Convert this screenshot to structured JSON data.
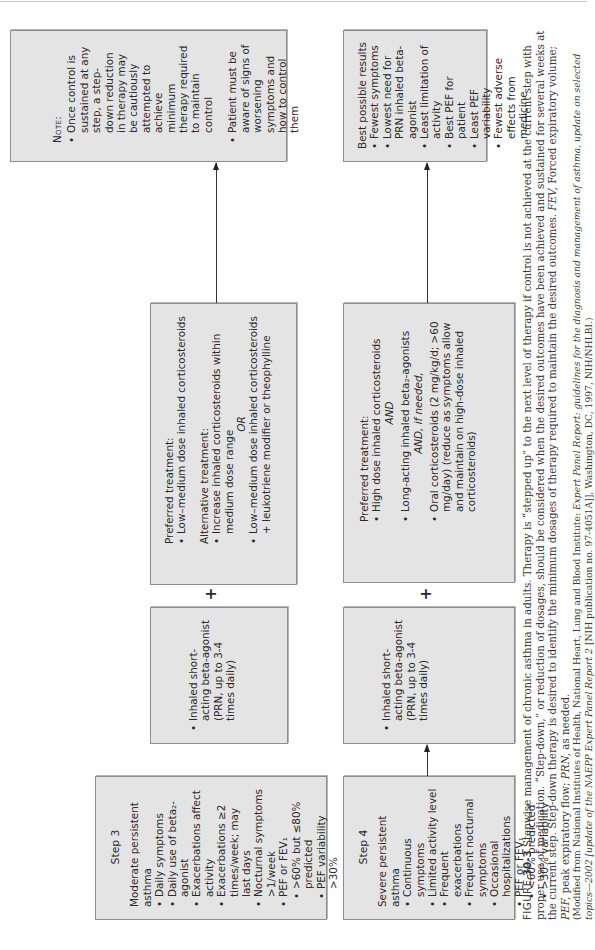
{
  "page": {
    "orientation": "rotated-landscape"
  },
  "step3": {
    "title": "Step 3",
    "severity": "Moderate persistent asthma",
    "items": [
      "Daily symptoms",
      "Daily use of beta₂-agonist",
      "Exacerbations affect activity",
      "Exacerbations ≥2 times/week; may last days",
      "Nocturnal symptoms >1/week",
      "PEF or FEV₁"
    ],
    "sub_items": [
      ">60% but ≤80% predicted",
      "PEF variability >30%"
    ]
  },
  "step4": {
    "title": "Step 4",
    "severity": "Severe persistent asthma",
    "items": [
      "Continuous symptoms",
      "Limited activity level",
      "Frequent exacerbations",
      "Frequent nocturnal symptoms",
      "Occasional hospitalizations",
      "PEF or FEV₁"
    ],
    "sub_items": [
      "<60% predicted",
      ">30% variability"
    ]
  },
  "saba3": {
    "items": [
      "Inhaled short-acting beta-agonist (PRN, up to 3-4 times daily)"
    ]
  },
  "saba4": {
    "items": [
      "Inhaled short-acting beta-agonist (PRN, up to 3-4 times daily)"
    ]
  },
  "plus_sign": "+",
  "pref3": {
    "preferred_label": "Preferred treatment:",
    "preferred_items": [
      "Low–medium dose inhaled corticosteroids"
    ],
    "alternative_label": "Alternative treatment:",
    "alternative_item_1": "Increase inhaled corticosteroids within medium dose range",
    "or_label": "OR",
    "alternative_item_2": "Low–medium dose inhaled corticosteroids",
    "alternative_item_2_addon": "+ leukotriene modifier or theophylline"
  },
  "pref4": {
    "preferred_label": "Preferred treatment:",
    "item_1": "High dose inhaled corticosteroids",
    "and_label": "AND",
    "item_2": "Long-acting inhaled beta₂-agonists",
    "and_if_needed_label": "AND, if needed,",
    "item_3": "Oral corticosteroids (2 mg/kg/d; >60 mg/day) (reduce as symptoms allow and maintain on high-dose inhaled corticosteroids)"
  },
  "note": {
    "heading": "Note:",
    "items": [
      "Once control is sustained at any step, a step-down reduction in therapy may be cautiously attempted to achieve minimum therapy required to maintain control",
      "Patient must be aware of signs of worsening symptoms and how to control them"
    ]
  },
  "best": {
    "heading": "Best possible results",
    "items": [
      "Fewest symptoms",
      "Lowest need for PRN inhaled beta-agonist",
      "Least limitation of activity",
      "Best PEF for patient",
      "Least PEF variability",
      "Fewest adverse effects from medicine"
    ]
  },
  "caption": {
    "figure_label": "FIGURE",
    "figure_number": "30-3",
    "text_1": " Stepwise management of chronic asthma in adults. Therapy is “stepped up” to the next level of therapy if control is not achieved at the current step with proper use of medication. “Step-down,” or reduction of dosages, should be considered when the desired outcomes have been achieved and sustained for several weeks at the current step. Step-down therapy is desired to identify the minimum dosages of therapy required to maintain the desired outcomes. ",
    "abbr_fev": "FEV,",
    "text_fev": " Forced expiratory volume; ",
    "abbr_pef": "PEF,",
    "text_pef": " peak expiratory flow; ",
    "abbr_prn": "PRN,",
    "text_prn": " as needed.",
    "source_1": "(Modified from National Institutes of Health, National Heart, Lung and Blood Institute: ",
    "source_italic": "Expert Panel Report: guidelines for the diagnosis and management of asthma, update on selected topics—2002 [update of the NAEPP Expert Panel Report 2",
    "source_2": " [NIH publication no. 97-4051A]], Washington, DC, 1997, NIH/NHLBI.)"
  }
}
